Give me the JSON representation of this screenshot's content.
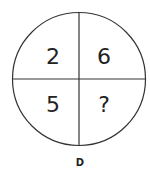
{
  "puzzle": {
    "cells": {
      "top_left": "2",
      "top_right": "6",
      "bottom_left": "5",
      "bottom_right": "?"
    },
    "option_label": "D"
  },
  "colors": {
    "stroke": "#333333",
    "text": "#222222",
    "background": "#ffffff"
  }
}
